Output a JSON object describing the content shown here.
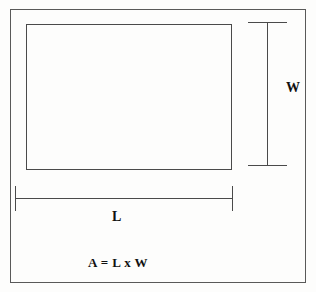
{
  "figure": {
    "background_color": "#fdfdfc",
    "line_color": "#4a4a4a",
    "text_color": "#111111"
  },
  "labels": {
    "width": "W",
    "length": "L",
    "formula": "A = L x W"
  },
  "chart_data": {
    "type": "diagram",
    "subtype": "geometry-rectangle-dimensions",
    "title": "",
    "shapes": [
      {
        "name": "outer-frame",
        "kind": "rectangle",
        "x": 10,
        "y": 9,
        "width": 296,
        "height": 274,
        "filled": false
      },
      {
        "name": "shape-rectangle",
        "kind": "rectangle",
        "x": 26,
        "y": 24,
        "width": 206,
        "height": 146,
        "filled": false
      }
    ],
    "dimension_lines": [
      {
        "name": "width-dimension",
        "label": "W",
        "orientation": "vertical",
        "x": 267,
        "y_start": 22,
        "y_end": 166,
        "cap_style": "serif",
        "cap_length": 39
      },
      {
        "name": "length-dimension",
        "label": "L",
        "orientation": "horizontal",
        "y": 198,
        "x_start": 15,
        "x_end": 233,
        "cap_style": "serif",
        "cap_length": 25
      }
    ],
    "annotations": [
      {
        "name": "width-label",
        "text": "W",
        "x": 288,
        "y": 88
      },
      {
        "name": "length-label",
        "text": "L",
        "x": 115,
        "y": 217
      },
      {
        "name": "area-formula",
        "text": "A = L x W",
        "x": 120,
        "y": 263
      }
    ]
  }
}
